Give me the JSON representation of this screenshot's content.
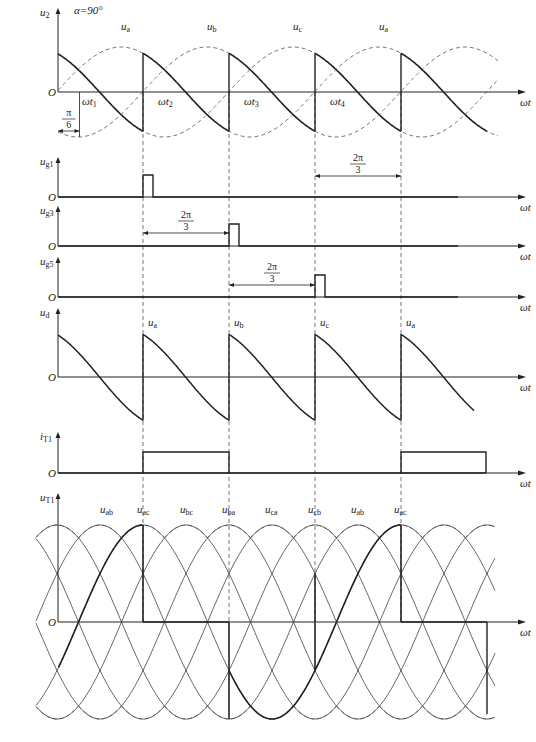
{
  "figure": {
    "alpha_label": "α=90°",
    "x_axis_label": "ωt",
    "origin_label": "O",
    "colors": {
      "ink": "#222222",
      "dashed": "#555555",
      "grid": "#666666"
    },
    "y_axis_x": 58,
    "period_px": 258,
    "trigger_lines_x": [
      143,
      229,
      315,
      401
    ],
    "axis_end_x": 518
  },
  "panels": {
    "u2": {
      "label": "u",
      "sub": "2",
      "zero_y": 92,
      "amplitude": 45,
      "phase_labels": [
        {
          "text": "u",
          "sub": "a",
          "x": 121,
          "y": 30
        },
        {
          "text": "u",
          "sub": "b",
          "x": 207,
          "y": 30
        },
        {
          "text": "u",
          "sub": "c",
          "x": 293,
          "y": 30
        },
        {
          "text": "u",
          "sub": "a",
          "x": 379,
          "y": 30
        }
      ],
      "time_labels": [
        {
          "text": "ωt",
          "sub": "1",
          "x": 82
        },
        {
          "text": "ωt",
          "sub": "2",
          "x": 158
        },
        {
          "text": "ωt",
          "sub": "3",
          "x": 244
        },
        {
          "text": "ωt",
          "sub": "4",
          "x": 330
        }
      ],
      "pi6_label": {
        "num": "π",
        "den": "6"
      }
    },
    "ug1": {
      "label": "u",
      "sub": "g1",
      "zero_y": 197,
      "pulse_x": 143,
      "pulse_w": 10,
      "pulse_h": 22,
      "arrow": {
        "from": 315,
        "to": 401,
        "num": "2π",
        "den": "3",
        "y": 176
      }
    },
    "ug3": {
      "label": "u",
      "sub": "g3",
      "zero_y": 246,
      "pulse_x": 229,
      "pulse_w": 10,
      "pulse_h": 22,
      "arrow": {
        "from": 143,
        "to": 229,
        "num": "2π",
        "den": "3",
        "y": 233
      }
    },
    "ug5": {
      "label": "u",
      "sub": "g5",
      "zero_y": 297,
      "pulse_x": 315,
      "pulse_w": 10,
      "pulse_h": 22,
      "arrow": {
        "from": 229,
        "to": 315,
        "num": "2π",
        "den": "3",
        "y": 285
      }
    },
    "ud": {
      "label": "u",
      "sub": "d",
      "zero_y": 377,
      "amplitude": 50,
      "segment_labels": [
        {
          "text": "u",
          "sub": "a",
          "x": 148
        },
        {
          "text": "u",
          "sub": "b",
          "x": 234
        },
        {
          "text": "u",
          "sub": "c",
          "x": 320
        },
        {
          "text": "u",
          "sub": "a",
          "x": 406
        }
      ]
    },
    "iT1": {
      "label": "i",
      "sub": "T1",
      "zero_y": 473,
      "height": 21,
      "on_intervals": [
        [
          143,
          229
        ],
        [
          401,
          486
        ]
      ]
    },
    "uT1": {
      "label": "u",
      "sub": "T1",
      "zero_y": 622,
      "amplitude": 97,
      "line_labels": [
        {
          "text": "u",
          "sub": "ab",
          "x": 100
        },
        {
          "text": "u",
          "sub": "ac",
          "x": 137
        },
        {
          "text": "u",
          "sub": "bc",
          "x": 180
        },
        {
          "text": "u",
          "sub": "ba",
          "x": 222
        },
        {
          "text": "u",
          "sub": "ca",
          "x": 265
        },
        {
          "text": "u",
          "sub": "cb",
          "x": 308
        },
        {
          "text": "u",
          "sub": "ab",
          "x": 351
        },
        {
          "text": "u",
          "sub": "ac",
          "x": 394
        }
      ]
    }
  }
}
